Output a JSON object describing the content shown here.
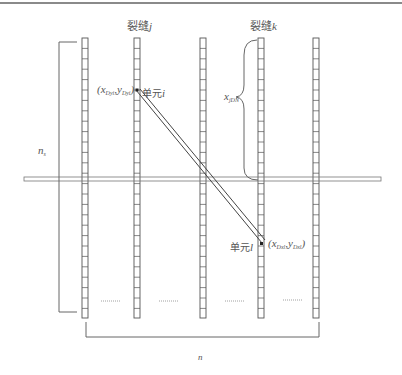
{
  "diagram": {
    "crack_labels": {
      "j": {
        "prefix": "裂缝",
        "var": "j"
      },
      "k": {
        "prefix": "裂缝",
        "var": "k"
      }
    },
    "element_i": {
      "coord_label": {
        "x": "x",
        "x_sub": "Dyi",
        "y": "y",
        "y_sub": "Dyi"
      },
      "name_prefix": "单元",
      "name_var": "i"
    },
    "element_l": {
      "coord_label": {
        "x": "x",
        "x_sub": "Dxl",
        "y": "y",
        "y_sub": "Dxl"
      },
      "name_prefix": "单元",
      "name_var": "l"
    },
    "brace_label": {
      "var": "x",
      "sub": "jDN"
    },
    "left_dimension": {
      "var": "n",
      "sub": "s"
    },
    "bottom_dimension": {
      "var": "n"
    },
    "columns": {
      "count": 5,
      "x_positions": [
        85,
        137,
        203,
        261,
        316
      ],
      "top": 38,
      "bottom": 318,
      "cell_height": 10.4
    },
    "ellipsis": "……",
    "colors": {
      "line": "#555555",
      "band": "#777777",
      "text": "#555555"
    }
  }
}
